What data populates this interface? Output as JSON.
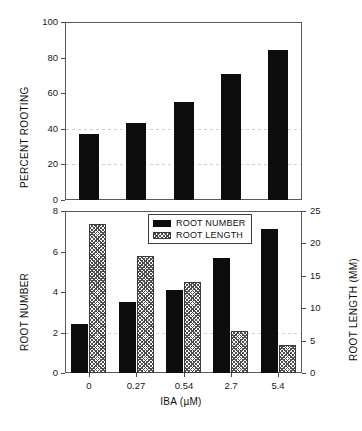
{
  "chart_data": [
    {
      "id": "percent_rooting",
      "type": "bar",
      "title": "",
      "panel": "top",
      "xlabel": "",
      "ylabel": "PERCENT ROOTING",
      "categories": [
        "0",
        "0.27",
        "0.54",
        "2.7",
        "5.4"
      ],
      "values": [
        37,
        43,
        55,
        71,
        84
      ],
      "series": [
        {
          "name": "PERCENT ROOTING",
          "values": [
            37,
            43,
            55,
            71,
            84
          ],
          "fill": "solid-black"
        }
      ],
      "ylim": [
        0,
        100
      ],
      "yticks": [
        0,
        20,
        40,
        60,
        80,
        100
      ],
      "ytick_labels": [
        "0",
        "20",
        "40",
        "60",
        "80",
        "100"
      ],
      "grid": "horizontal-dashed-faint",
      "gridline_values": [
        20,
        40
      ],
      "legend": "none"
    },
    {
      "id": "root_number_and_length",
      "type": "bar",
      "title": "",
      "panel": "bottom",
      "xlabel": "IBA (µM)",
      "ylabel": "ROOT NUMBER",
      "y2label": "ROOT LENGTH (MM)",
      "categories": [
        "0",
        "0.27",
        "0.54",
        "2.7",
        "5.4"
      ],
      "series": [
        {
          "name": "ROOT NUMBER",
          "axis": "left",
          "fill": "solid-black",
          "values": [
            2.4,
            3.5,
            4.1,
            5.7,
            7.1
          ]
        },
        {
          "name": "ROOT LENGTH",
          "axis": "right",
          "fill": "crosshatch",
          "values": [
            23.0,
            18.0,
            14.0,
            6.5,
            4.3
          ]
        }
      ],
      "ylim": [
        0,
        8
      ],
      "yticks": [
        0,
        2,
        4,
        6,
        8
      ],
      "ytick_labels": [
        "0",
        "2",
        "4",
        "6",
        "8"
      ],
      "y2lim": [
        0,
        25
      ],
      "y2ticks": [
        0,
        5,
        10,
        15,
        20,
        25
      ],
      "y2tick_labels": [
        "0",
        "5",
        "10",
        "15",
        "20",
        "25"
      ],
      "grid": "horizontal-dashed-faint",
      "gridline_values": [
        2
      ],
      "legend_position": "upper-center"
    }
  ],
  "top_panel": {
    "y_axis": {
      "title": "PERCENT ROOTING",
      "ticks": [
        {
          "label": "100",
          "value": 100
        },
        {
          "label": "80",
          "value": 80
        },
        {
          "label": "60",
          "value": 60
        },
        {
          "label": "40",
          "value": 40
        },
        {
          "label": "20",
          "value": 20
        },
        {
          "label": "0",
          "value": 0
        }
      ]
    },
    "bars": [
      {
        "category": "0",
        "value": 37
      },
      {
        "category": "0.27",
        "value": 43
      },
      {
        "category": "0.54",
        "value": 55
      },
      {
        "category": "2.7",
        "value": 71
      },
      {
        "category": "5.4",
        "value": 84
      }
    ]
  },
  "bottom_panel": {
    "y_axis_left": {
      "title": "ROOT NUMBER",
      "ticks": [
        {
          "label": "8",
          "value": 8
        },
        {
          "label": "6",
          "value": 6
        },
        {
          "label": "4",
          "value": 4
        },
        {
          "label": "2",
          "value": 2
        },
        {
          "label": "0",
          "value": 0
        }
      ]
    },
    "y_axis_right": {
      "title": "ROOT LENGTH (MM)",
      "ticks": [
        {
          "label": "25",
          "value": 25
        },
        {
          "label": "20",
          "value": 20
        },
        {
          "label": "15",
          "value": 15
        },
        {
          "label": "10",
          "value": 10
        },
        {
          "label": "5",
          "value": 5
        },
        {
          "label": "0",
          "value": 0
        }
      ]
    },
    "x_axis": {
      "title": "IBA (µM)",
      "ticks": [
        "0",
        "0.27",
        "0.54",
        "2.7",
        "5.4"
      ]
    },
    "legend": {
      "items": [
        {
          "label": "ROOT NUMBER",
          "fill": "solid-black"
        },
        {
          "label": "ROOT LENGTH",
          "fill": "crosshatch"
        }
      ]
    },
    "groups": [
      {
        "category": "0",
        "root_number": 2.4,
        "root_length": 23.0
      },
      {
        "category": "0.27",
        "root_number": 3.5,
        "root_length": 18.0
      },
      {
        "category": "0.54",
        "root_number": 4.1,
        "root_length": 14.0
      },
      {
        "category": "2.7",
        "root_number": 5.7,
        "root_length": 6.5
      },
      {
        "category": "5.4",
        "root_number": 7.1,
        "root_length": 4.3
      }
    ]
  },
  "colors": {
    "solid_bar": "#0d0d0d",
    "hatch_line": "#4e4e4e",
    "axis": "#5a5a5a",
    "gridline": "#c9c9c9",
    "text": "#111111",
    "background": "#ffffff"
  }
}
